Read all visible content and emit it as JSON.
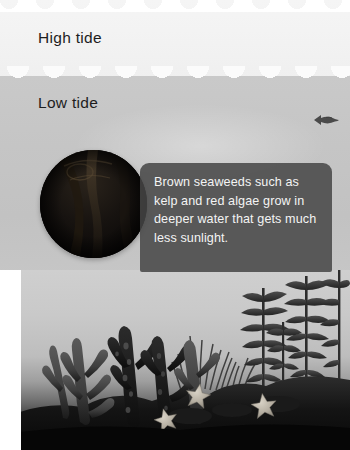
{
  "figure": {
    "labels": {
      "high_tide": "High tide",
      "low_tide": "Low tide"
    },
    "callout": {
      "text": "Brown seaweeds such as kelp and red algae grow in deeper water that gets much less sunlight."
    },
    "inset_photo": {
      "alt": "Dark close-up underwater photograph of brown seaweed"
    },
    "scene": {
      "alt": "Underwater scene with kelp fronds, sea grass and starfish on the seabed",
      "organisms": [
        {
          "name": "branching-kelp-cluster",
          "count": 5
        },
        {
          "name": "sea-grass-tuft",
          "count": 3
        },
        {
          "name": "leafy-kelp-plant",
          "count": 4
        },
        {
          "name": "starfish",
          "count": 3
        },
        {
          "name": "fish",
          "count": 1
        }
      ]
    },
    "colors": {
      "high_tide_water": "#f2f2f2",
      "low_tide_water": "#c5c5c5",
      "deep_water": "#bdbdbd",
      "seabed": "#0e0e0e",
      "callout_fill": "#464646",
      "callout_text": "#f4f4f4",
      "label_text": "#1d1d1d",
      "starfish": "#b9b2a6",
      "kelp_dark": "#3a3a3a"
    }
  }
}
